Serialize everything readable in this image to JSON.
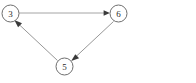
{
  "diagram": {
    "type": "directed-graph",
    "background_color": "#ffffff",
    "node_stroke_color": "#6e6e6e",
    "node_fill_color": "#ffffff",
    "edge_color": "#9a9a9a",
    "arrow_color": "#3a3a3a",
    "label_color": "#2b2b2b",
    "nodes": [
      {
        "id": "3",
        "label": "3",
        "cx": 10.5,
        "cy": 13.5,
        "r": 8.5
      },
      {
        "id": "6",
        "label": "6",
        "cx": 118.5,
        "cy": 13.5,
        "r": 8.5
      },
      {
        "id": "5",
        "label": "5",
        "cx": 64.5,
        "cy": 66.5,
        "r": 8.5
      }
    ],
    "edges": [
      {
        "id": "edge-3-6",
        "from": "3",
        "to": "6",
        "directed": true,
        "label": ""
      },
      {
        "id": "edge-6-5",
        "from": "6",
        "to": "5",
        "directed": true,
        "label": ""
      },
      {
        "id": "edge-5-3",
        "from": "5",
        "to": "3",
        "directed": true,
        "label": ""
      }
    ]
  }
}
